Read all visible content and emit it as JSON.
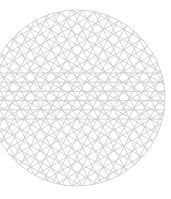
{
  "figure": {
    "type": "line-pattern-in-circle",
    "width": 171,
    "height": 199,
    "background": "#ffffff",
    "stroke_color": "#c9c9c9",
    "stroke_width": 0.8,
    "circle": {
      "cx": 77,
      "cy": 98,
      "r": 88
    },
    "families": [
      {
        "angle_deg": 0,
        "spacing": 9.2,
        "count": 6,
        "offset": -2
      },
      {
        "angle_deg": 30,
        "spacing": 9.2,
        "count": 19,
        "offset": 0
      },
      {
        "angle_deg": -30,
        "spacing": 9.2,
        "count": 19,
        "offset": 0
      },
      {
        "angle_deg": 62,
        "spacing": 9.2,
        "count": 19,
        "offset": 0
      },
      {
        "angle_deg": -62,
        "spacing": 9.2,
        "count": 19,
        "offset": 0
      }
    ]
  }
}
